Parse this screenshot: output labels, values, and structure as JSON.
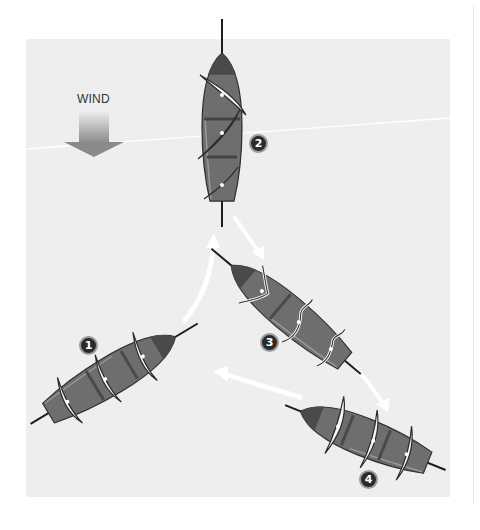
{
  "diagram": {
    "wind_label": "WIND",
    "wind_arrow_icon": "wind-direction-arrow-down",
    "colors": {
      "background": "#ffffff",
      "panel": "#eeeeee",
      "hull": "#6e6e6e",
      "hull_dark": "#4a4a4a",
      "sail": "#f4f4f4",
      "mast": "#1e1e1e",
      "badge": "#2a2a2a",
      "path_arrow": "#ffffff"
    },
    "positions": [
      {
        "number": "1",
        "description": "Boat pointing up-right, sails across hull"
      },
      {
        "number": "2",
        "description": "Boat pointing straight into the wind (head to wind)"
      },
      {
        "number": "3",
        "description": "Boat turned, bow up-left, drifting backward"
      },
      {
        "number": "4",
        "description": "Boat bow down-left, sails eased"
      }
    ],
    "transitions": [
      {
        "from": "1",
        "to": "2"
      },
      {
        "from": "2",
        "to": "3"
      },
      {
        "from": "3",
        "to": "4"
      },
      {
        "from": "4",
        "to": "1"
      }
    ]
  }
}
